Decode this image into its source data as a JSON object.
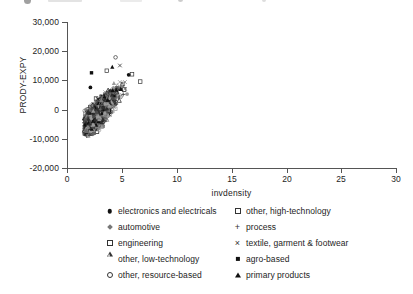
{
  "chart_data": {
    "type": "scatter",
    "title": "",
    "xlabel": "invdensity",
    "ylabel": "PRODY-EXPY",
    "xlim": [
      0,
      30
    ],
    "ylim": [
      -20000,
      30000
    ],
    "xticks": [
      0,
      5,
      10,
      15,
      20,
      25,
      30
    ],
    "xtick_labels": [
      "0",
      "5",
      "10",
      "15",
      "20",
      "25",
      "30"
    ],
    "yticks": [
      -20000,
      -10000,
      0,
      10000,
      20000,
      30000
    ],
    "ytick_labels": [
      "-20,000",
      "-10,000",
      "0",
      "10,000",
      "20,000",
      "30,000"
    ],
    "grid": false,
    "legend_position": "below-plot",
    "series": [
      {
        "name": "electronics and electricals",
        "marker": "filled-circle",
        "n_points": 220,
        "x_range": [
          1.3,
          7.2
        ],
        "y_range": [
          -8500,
          16500
        ]
      },
      {
        "name": "other, high-technology",
        "marker": "open-square",
        "n_points": 200,
        "x_range": [
          1.3,
          7.4
        ],
        "y_range": [
          -8500,
          17500
        ]
      },
      {
        "name": "automotive",
        "marker": "diamond",
        "n_points": 190,
        "x_range": [
          1.3,
          6.9
        ],
        "y_range": [
          -8800,
          15500
        ]
      },
      {
        "name": "process",
        "marker": "plus",
        "n_points": 260,
        "x_range": [
          1.2,
          7.0
        ],
        "y_range": [
          -9000,
          15000
        ]
      },
      {
        "name": "engineering",
        "marker": "open-square",
        "n_points": 230,
        "x_range": [
          1.3,
          7.3
        ],
        "y_range": [
          -8600,
          16000
        ]
      },
      {
        "name": "textile, garment & footwear",
        "marker": "cross",
        "n_points": 250,
        "x_range": [
          1.2,
          6.8
        ],
        "y_range": [
          -9200,
          14500
        ]
      },
      {
        "name": "other, low-technology",
        "marker": "open-triangle",
        "n_points": 240,
        "x_range": [
          1.2,
          6.9
        ],
        "y_range": [
          -9000,
          15200
        ]
      },
      {
        "name": "agro-based",
        "marker": "filled-square",
        "n_points": 230,
        "x_range": [
          1.2,
          6.7
        ],
        "y_range": [
          -9000,
          14800
        ]
      },
      {
        "name": "other, resource-based",
        "marker": "open-circle",
        "n_points": 210,
        "x_range": [
          1.2,
          6.8
        ],
        "y_range": [
          -8800,
          18500
        ]
      },
      {
        "name": "primary products",
        "marker": "filled-triangle",
        "n_points": 260,
        "x_range": [
          1.2,
          6.9
        ],
        "y_range": [
          -9300,
          14000
        ]
      }
    ],
    "cloud_description": "dense overlapping point cloud concentrated between invdensity 1.5 and 6.5, PRODY-EXPY from about -9,000 to +18,000, elongated along a positive diagonal"
  },
  "axes": {
    "y": {
      "label": "PRODY-EXPY",
      "ticks": [
        {
          "value": 30000,
          "label": "30,000"
        },
        {
          "value": 20000,
          "label": "20,000"
        },
        {
          "value": 10000,
          "label": "10,000"
        },
        {
          "value": 0,
          "label": "0"
        },
        {
          "value": -10000,
          "label": "-10,000"
        },
        {
          "value": -20000,
          "label": "-20,000"
        }
      ]
    },
    "x": {
      "label": "invdensity",
      "ticks": [
        {
          "value": 0,
          "label": "0"
        },
        {
          "value": 5,
          "label": "5"
        },
        {
          "value": 10,
          "label": "10"
        },
        {
          "value": 15,
          "label": "15"
        },
        {
          "value": 20,
          "label": "20"
        },
        {
          "value": 25,
          "label": "25"
        },
        {
          "value": 30,
          "label": "30"
        }
      ]
    }
  },
  "legend": {
    "left_column": [
      {
        "label": "electronics and electricals",
        "marker": "filled-circle"
      },
      {
        "label": "automotive",
        "marker": "diamond"
      },
      {
        "label": "engineering",
        "marker": "open-square"
      },
      {
        "label": "other, low-technology",
        "marker": "open-triangle"
      },
      {
        "label": "other, resource-based",
        "marker": "open-circle"
      }
    ],
    "right_column": [
      {
        "label": "other, high-technology",
        "marker": "open-square"
      },
      {
        "label": "process",
        "marker": "plus"
      },
      {
        "label": "textile, garment & footwear",
        "marker": "cross"
      },
      {
        "label": "agro-based",
        "marker": "filled-square"
      },
      {
        "label": "primary products",
        "marker": "filled-triangle"
      }
    ]
  },
  "colors": {
    "background": "#ffffff",
    "axis": "#555555",
    "text": "#1d1d1d",
    "marker_dark": "#111111",
    "marker_mid": "#555555",
    "marker_light": "#9a9a9a"
  }
}
